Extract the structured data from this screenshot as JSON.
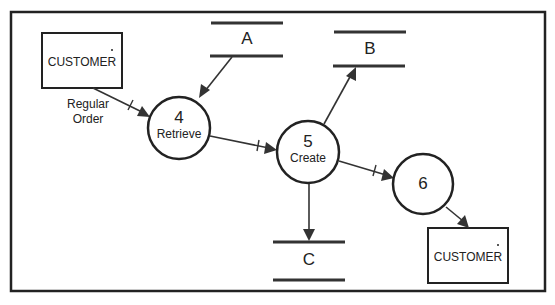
{
  "diagram": {
    "type": "data-flow-diagram",
    "colors": {
      "stroke": "#222222",
      "background": "#ffffff"
    },
    "entities": [
      {
        "id": "customer_source",
        "label": "CUSTOMER"
      },
      {
        "id": "customer_sink",
        "label": "CUSTOMER"
      }
    ],
    "data_stores": [
      {
        "id": "A",
        "label": "A"
      },
      {
        "id": "B",
        "label": "B"
      },
      {
        "id": "C",
        "label": "C"
      }
    ],
    "processes": [
      {
        "id": "4",
        "number": "4",
        "name": "Retrieve"
      },
      {
        "id": "5",
        "number": "5",
        "name": "Create"
      },
      {
        "id": "6",
        "number": "6",
        "name": ""
      }
    ],
    "flows": [
      {
        "from": "customer_source",
        "to": "4",
        "label_line1": "Regular",
        "label_line2": "Order",
        "tick": true
      },
      {
        "from": "A",
        "to": "4",
        "tick": false
      },
      {
        "from": "4",
        "to": "5",
        "tick": true
      },
      {
        "from": "5",
        "to": "B",
        "tick": false
      },
      {
        "from": "5",
        "to": "C",
        "tick": false
      },
      {
        "from": "5",
        "to": "6",
        "tick": true
      },
      {
        "from": "6",
        "to": "customer_sink",
        "tick": false
      }
    ]
  }
}
